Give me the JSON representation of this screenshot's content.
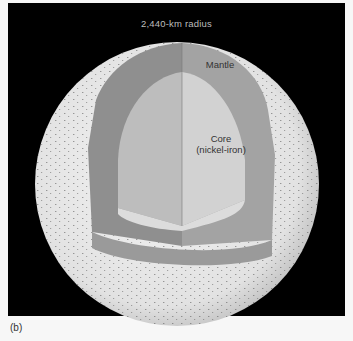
{
  "figure": {
    "title": "2,440-km radius",
    "caption": "(b)",
    "layers": [
      {
        "name": "Mantle",
        "label": "Mantle",
        "color": "#9a9a9a"
      },
      {
        "name": "Core",
        "label_line1": "Core",
        "label_line2": "(nickel-iron)",
        "color": "#cfcfcf"
      }
    ],
    "surface_color": "#e8e8e8",
    "background_color": "#000000"
  }
}
